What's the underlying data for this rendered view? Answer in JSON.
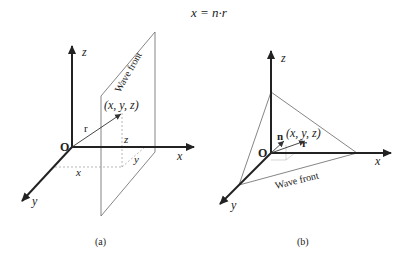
{
  "equation": "x = n·r",
  "panels": [
    {
      "id": "a",
      "caption": "(a)",
      "axes": {
        "x": "x",
        "y": "y",
        "z": "z",
        "origin": "O"
      },
      "vector_label": "r",
      "point_label": "(x, y, z)",
      "plane_label": "Wave front",
      "projection_labels": {
        "x": "x",
        "y": "y",
        "z": "z"
      }
    },
    {
      "id": "b",
      "caption": "(b)",
      "axes": {
        "x": "x",
        "y": "y",
        "z": "z",
        "origin": "O"
      },
      "vector_label": "r",
      "normal_label": "n",
      "point_label": "(x, y, z)",
      "plane_label": "Wave front"
    }
  ],
  "colors": {
    "ink": "#222222",
    "thin": "#555555",
    "dashed": "#999999",
    "background": "#ffffff"
  }
}
